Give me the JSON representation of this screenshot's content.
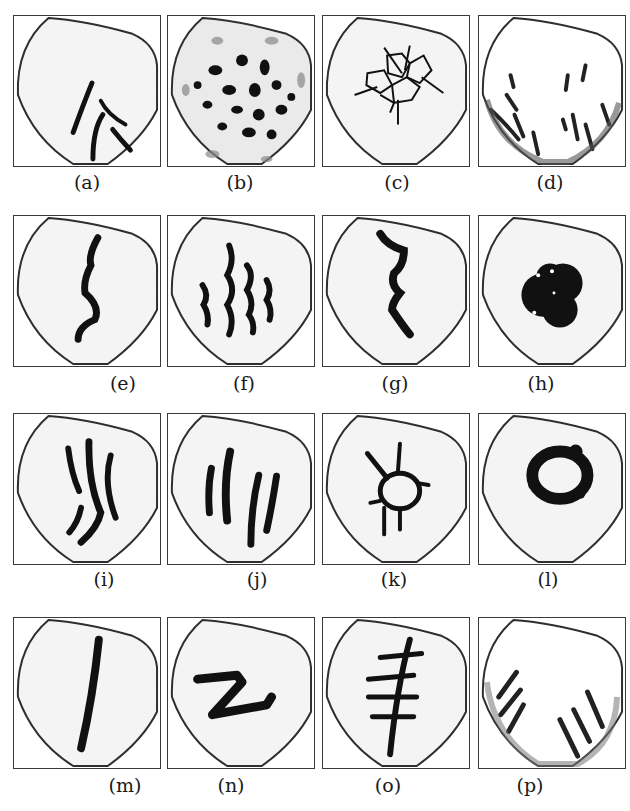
{
  "figure": {
    "panels": [
      {
        "id": "a",
        "label": "(a)",
        "pattern": "branched-streaks"
      },
      {
        "id": "b",
        "label": "(b)",
        "pattern": "spots"
      },
      {
        "id": "c",
        "label": "(c)",
        "pattern": "cracked-network"
      },
      {
        "id": "d",
        "label": "(d)",
        "pattern": "edge-streaks"
      },
      {
        "id": "e",
        "label": "(e)",
        "pattern": "single-wavy-line"
      },
      {
        "id": "f",
        "label": "(f)",
        "pattern": "multiple-wavy-lines"
      },
      {
        "id": "g",
        "label": "(g)",
        "pattern": "thick-wavy-line"
      },
      {
        "id": "h",
        "label": "(h)",
        "pattern": "central-blob"
      },
      {
        "id": "i",
        "label": "(i)",
        "pattern": "curved-streaks"
      },
      {
        "id": "j",
        "label": "(j)",
        "pattern": "parallel-streaks"
      },
      {
        "id": "k",
        "label": "(k)",
        "pattern": "star-ring"
      },
      {
        "id": "l",
        "label": "(l)",
        "pattern": "ring"
      },
      {
        "id": "m",
        "label": "(m)",
        "pattern": "single-straight-line"
      },
      {
        "id": "n",
        "label": "(n)",
        "pattern": "z-shape"
      },
      {
        "id": "o",
        "label": "(o)",
        "pattern": "fishbone"
      },
      {
        "id": "p",
        "label": "(p)",
        "pattern": "edge-diagonal-stripes"
      }
    ],
    "colors": {
      "outline": "#2e2e2e",
      "mark": "#111111",
      "fill": "#f4f4f4",
      "border": "#3a3a3a"
    }
  }
}
